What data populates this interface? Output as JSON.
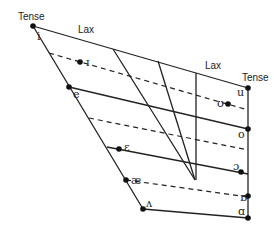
{
  "diagram": {
    "labels": {
      "tense_left": "Tense",
      "lax_left": "Lax",
      "lax_right": "Lax",
      "tense_right": "Tense"
    },
    "vowels": [
      {
        "symbol": "i",
        "type": "tense",
        "side": "front"
      },
      {
        "symbol": "ɪ",
        "type": "lax",
        "side": "front"
      },
      {
        "symbol": "e",
        "type": "tense",
        "side": "front"
      },
      {
        "symbol": "ɛ",
        "type": "lax",
        "side": "front"
      },
      {
        "symbol": "æ",
        "type": "lax",
        "side": "front"
      },
      {
        "symbol": "ʌ",
        "type": "tense",
        "side": "front"
      },
      {
        "symbol": "u",
        "type": "tense",
        "side": "back"
      },
      {
        "symbol": "ʊ",
        "type": "lax",
        "side": "back"
      },
      {
        "symbol": "o",
        "type": "tense",
        "side": "back"
      },
      {
        "symbol": "ɔ",
        "type": "lax",
        "side": "back"
      },
      {
        "symbol": "ɒ",
        "type": "tense",
        "side": "back"
      },
      {
        "symbol": "ɑ",
        "type": "tense",
        "side": "back"
      }
    ]
  }
}
